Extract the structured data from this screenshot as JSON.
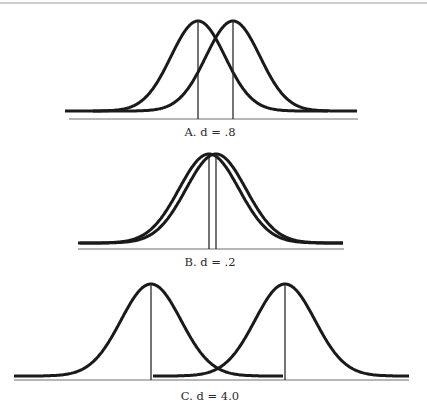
{
  "figure": {
    "top_rule": {
      "y": 3,
      "x1": 0,
      "x2": 427
    },
    "panels": [
      {
        "id": "A",
        "label": "A. d = .8",
        "label_pos": {
          "x": 210,
          "y": 125
        },
        "baseline": {
          "y": 119,
          "x1": 69,
          "x2": 358
        },
        "peak_y": 21,
        "tail_y": 111,
        "sigma": 27,
        "distributions": [
          {
            "mean_x": 198,
            "x_start": 65,
            "x_end": 328
          },
          {
            "mean_x": 233,
            "x_start": 93,
            "x_end": 357
          }
        ]
      },
      {
        "id": "B",
        "label": "B. d = .2",
        "label_pos": {
          "x": 210,
          "y": 255
        },
        "baseline": {
          "y": 249,
          "x1": 78,
          "x2": 344
        },
        "peak_y": 154,
        "tail_y": 243,
        "sigma": 30,
        "distributions": [
          {
            "mean_x": 209,
            "x_start": 78,
            "x_end": 343
          },
          {
            "mean_x": 216,
            "x_start": 80,
            "x_end": 343
          }
        ]
      },
      {
        "id": "C",
        "label": "C. d = 4.0",
        "label_pos": {
          "x": 210,
          "y": 389
        },
        "baseline": {
          "y": 380,
          "x1": 14,
          "x2": 409
        },
        "peak_y": 284,
        "tail_y": 376,
        "sigma": 30,
        "distributions": [
          {
            "mean_x": 151,
            "x_start": 14,
            "x_end": 283
          },
          {
            "mean_x": 285,
            "x_start": 153,
            "x_end": 409
          }
        ]
      }
    ]
  }
}
